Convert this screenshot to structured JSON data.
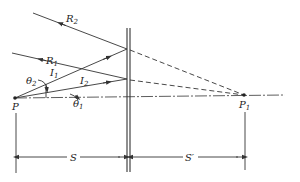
{
  "diagram": {
    "type": "optics-ray-diagram",
    "labels": {
      "R2": {
        "main": "R",
        "sub": "2"
      },
      "R1": {
        "main": "R",
        "sub": "1"
      },
      "I1": {
        "main": "I",
        "sub": "1"
      },
      "I2": {
        "main": "I",
        "sub": "2"
      },
      "theta2": {
        "main": "θ",
        "sub": "2"
      },
      "theta1": {
        "main": "θ",
        "sub": "1"
      },
      "P": {
        "main": "P",
        "sub": ""
      },
      "P1": {
        "main": "P",
        "sub": "1"
      },
      "S": {
        "main": "S"
      },
      "S_prime": {
        "main": "S′"
      }
    },
    "points": {
      "P": [
        15,
        98
      ],
      "P1": [
        244,
        95
      ]
    },
    "colors": {
      "stroke": "#333333",
      "background": "#ffffff"
    }
  }
}
